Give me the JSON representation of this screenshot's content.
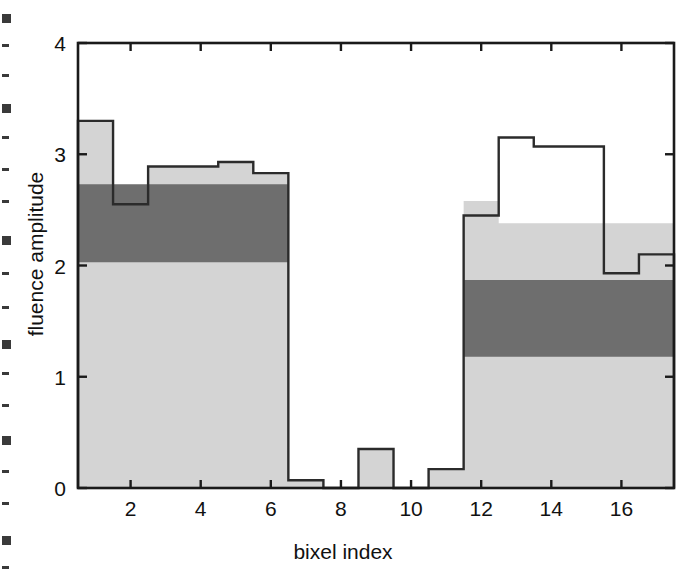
{
  "figure": {
    "background": "#ffffff",
    "axis_color": "#1a1a1a",
    "colors": {
      "light_gray": "#d4d4d4",
      "dark_gray": "#6e6e6e",
      "outline": "#2b2b2b"
    }
  },
  "chart_data": {
    "type": "bar",
    "title": "",
    "xlabel": "bixel index",
    "ylabel": "fluence amplitude",
    "xlim": [
      0.5,
      17.5
    ],
    "ylim": [
      0,
      4
    ],
    "grid": false,
    "legend": null,
    "x_ticks": [
      2,
      4,
      6,
      8,
      10,
      12,
      14,
      16
    ],
    "x_tick_labels": [
      "2",
      "4",
      "6",
      "8",
      "10",
      "12",
      "14",
      "16"
    ],
    "y_ticks": [
      0,
      1,
      2,
      3,
      4
    ],
    "y_tick_labels": [
      "0",
      "1",
      "2",
      "3",
      "4"
    ],
    "categories": [
      1,
      2,
      3,
      4,
      5,
      6,
      7,
      8,
      9,
      10,
      11,
      12,
      13,
      14,
      15,
      16,
      17
    ],
    "series": [
      {
        "name": "total fluence (outline)",
        "style": "step-outline",
        "values": [
          3.3,
          2.55,
          2.89,
          2.89,
          2.93,
          2.83,
          0.07,
          0.0,
          0.35,
          0.0,
          0.17,
          2.45,
          3.15,
          3.07,
          3.07,
          1.93,
          2.1
        ]
      },
      {
        "name": "dark-gray band upper edge",
        "style": "filled-dark",
        "values": [
          2.73,
          2.73,
          2.73,
          2.73,
          2.73,
          2.73,
          0.0,
          0.0,
          0.0,
          0.0,
          0.0,
          1.87,
          1.87,
          1.87,
          1.87,
          1.87,
          1.87
        ]
      },
      {
        "name": "dark-gray band lower edge",
        "style": "filled-dark",
        "values": [
          2.03,
          2.03,
          2.03,
          2.03,
          2.03,
          2.03,
          0.0,
          0.0,
          0.0,
          0.0,
          0.0,
          1.18,
          1.18,
          1.18,
          1.18,
          1.18,
          1.18
        ]
      },
      {
        "name": "light-gray fill upper edge",
        "style": "filled-light",
        "values": [
          3.3,
          2.55,
          2.89,
          2.89,
          2.93,
          2.83,
          0.07,
          0.0,
          0.35,
          0.0,
          0.17,
          2.58,
          2.38,
          2.38,
          2.38,
          2.38,
          2.38
        ]
      }
    ]
  },
  "ticks": {
    "y": [
      "4",
      "3",
      "2",
      "1",
      "0"
    ],
    "x": [
      "2",
      "4",
      "6",
      "8",
      "10",
      "12",
      "14",
      "16"
    ]
  },
  "labels": {
    "y_axis": "fluence amplitude",
    "x_axis": "bixel index"
  }
}
